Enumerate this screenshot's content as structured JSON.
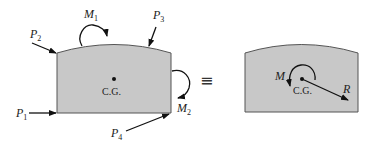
{
  "colors": {
    "body_fill": "#c8c8c8",
    "outline": "#555555",
    "ink": "#111111"
  },
  "left_diagram": {
    "forces": [
      {
        "symbol": "P",
        "sub": "1"
      },
      {
        "symbol": "P",
        "sub": "2"
      },
      {
        "symbol": "P",
        "sub": "3"
      },
      {
        "symbol": "P",
        "sub": "4"
      }
    ],
    "moments": [
      {
        "symbol": "M",
        "sub": "1"
      },
      {
        "symbol": "M",
        "sub": "2"
      }
    ],
    "center_label": "C.G."
  },
  "equivalence_symbol": "≡",
  "right_diagram": {
    "moment": "M",
    "resultant": "R",
    "center_label": "C.G."
  }
}
